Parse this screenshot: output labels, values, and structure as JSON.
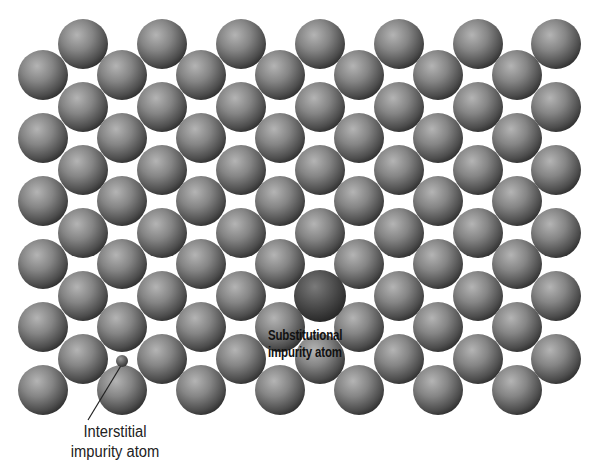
{
  "figure": {
    "colors": {
      "background": "#ffffff",
      "host_atom": "#7a7a7a",
      "substitutional_atom": "#4a4a4a",
      "interstitial_atom": "#555555",
      "label_text": "#111111"
    },
    "lattice": {
      "atom_radius": 25,
      "row_spacing": 31.5,
      "col_spacing": 79,
      "rows_a_x": [
        83,
        162,
        241,
        320,
        399,
        478,
        556
      ],
      "rows_b_x": [
        43,
        122,
        201,
        280,
        359,
        438,
        517
      ],
      "rows_a_y": [
        44,
        107,
        170,
        233,
        296,
        359
      ],
      "rows_b_y": [
        75,
        138,
        201,
        264,
        327,
        390
      ]
    },
    "substitutional": {
      "x": 320,
      "y": 296,
      "r": 26
    },
    "interstitial": {
      "x": 122,
      "y": 361,
      "r": 6
    },
    "leader_line": {
      "x1": 122,
      "y1": 364,
      "x2": 88,
      "y2": 420
    }
  },
  "labels": {
    "substitutional": [
      "Substitutional",
      "impurity atom"
    ],
    "interstitial": [
      "Interstitial",
      "impurity atom"
    ]
  }
}
